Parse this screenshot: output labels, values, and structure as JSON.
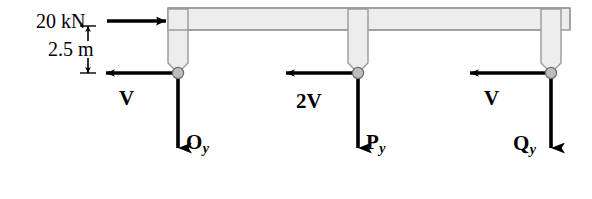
{
  "diagram": {
    "applied_load": {
      "label": "20 kN",
      "direction": "right",
      "applied_at": "top-left corner of beam"
    },
    "dimension": {
      "label": "2.5 m",
      "orientation": "vertical",
      "from": "load line",
      "to": "pin support line"
    },
    "supports": [
      {
        "name": "O",
        "shear_label": "V",
        "shear_direction": "left",
        "reaction_label": "O",
        "reaction_subscript": "y",
        "reaction_direction": "down",
        "reaction_label_side": "right"
      },
      {
        "name": "P",
        "shear_label": "2V",
        "shear_direction": "left",
        "reaction_label": "P",
        "reaction_subscript": "y",
        "reaction_direction": "down",
        "reaction_label_side": "right"
      },
      {
        "name": "Q",
        "shear_label": "V",
        "shear_direction": "left",
        "reaction_label": "Q",
        "reaction_subscript": "y",
        "reaction_direction": "down",
        "reaction_label_side": "left"
      }
    ],
    "colors": {
      "member_fill": "#ededed",
      "member_stroke": "#9a9a9a",
      "arrow": "#000000",
      "pin_fill": "#bdbdbd",
      "pin_stroke": "#6b6b6b",
      "background": "#ffffff"
    }
  }
}
